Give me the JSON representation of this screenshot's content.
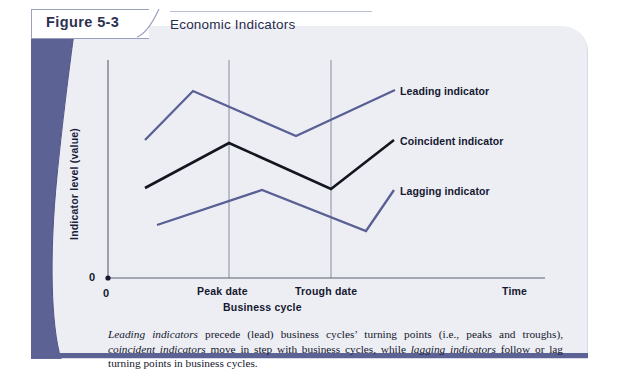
{
  "figure": {
    "number_label": "Figure 5-3",
    "title": "Economic Indicators"
  },
  "chart_data": {
    "type": "line",
    "title": "Economic Indicators",
    "xlabel": "Business cycle",
    "ylabel": "Indicator level (value)",
    "x_axis_end_label": "Time",
    "origin_label_y": "0",
    "origin_label_x": "0",
    "xticks": [
      "Peak date",
      "Trough date"
    ],
    "xtick_positions": [
      229,
      331
    ],
    "grid": false,
    "legend_position": "right-inline",
    "series": [
      {
        "name": "Leading indicator",
        "color": "#5a5f94",
        "label_x": 400,
        "label_y": 85,
        "points": [
          [
            145,
            140
          ],
          [
            193,
            91
          ],
          [
            296,
            136
          ],
          [
            395,
            90
          ]
        ],
        "description": "peaks and troughs before the business cycle turning points"
      },
      {
        "name": "Coincident indicator",
        "color": "#131521",
        "label_x": 400,
        "label_y": 136,
        "points": [
          [
            145,
            188
          ],
          [
            229,
            143
          ],
          [
            331,
            189
          ],
          [
            394,
            140
          ]
        ],
        "description": "peaks and troughs in step with the business cycle turning points"
      },
      {
        "name": "Lagging indicator",
        "color": "#5a5f94",
        "label_x": 400,
        "label_y": 187,
        "points": [
          [
            157,
            225
          ],
          [
            262,
            190
          ],
          [
            366,
            231
          ],
          [
            394,
            190
          ]
        ],
        "description": "peaks and troughs after the business cycle turning points"
      }
    ],
    "axis_origin": [
      108,
      278
    ],
    "axis_x_end": 545,
    "axis_y_top": 60
  },
  "caption": {
    "text_parts": [
      {
        "style": "italic",
        "text": "Leading indicators"
      },
      {
        "style": "normal",
        "text": " precede (lead) business cycles’ turning points (i.e., peaks and troughs), "
      },
      {
        "style": "italic",
        "text": "coincident indicators"
      },
      {
        "style": "normal",
        "text": " move in step with business cycles, while "
      },
      {
        "style": "italic",
        "text": "lagging indicators"
      },
      {
        "style": "normal",
        "text": " follow or lag turning points in business cycles."
      }
    ]
  },
  "colors": {
    "panel_background": "#eceef4",
    "accent_purple": "#5d6295",
    "line_purple": "#5a5f94",
    "line_black": "#131521",
    "axis": "#5b6070",
    "text_dark": "#15182f"
  }
}
